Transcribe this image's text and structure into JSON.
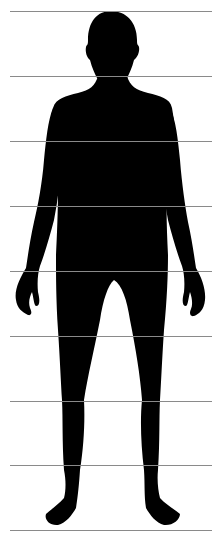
{
  "diagram": {
    "type": "human-body-proportion-chart",
    "silhouette_color": "#000000",
    "background_color": "#ffffff",
    "guide_line_color": "#8a8a8a",
    "guide_line_count": 9,
    "guide_lines_y": [
      11,
      76,
      141,
      206,
      271,
      336,
      401,
      465,
      530
    ],
    "guide_line_x_range": [
      10,
      212
    ],
    "head_units": 8
  }
}
